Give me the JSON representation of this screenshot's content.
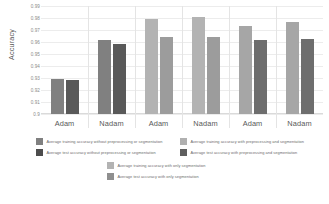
{
  "chart_data": {
    "type": "bar",
    "title": "",
    "xlabel": "",
    "ylabel": "Accuracy",
    "ylim": [
      0.9,
      0.99
    ],
    "grid": true,
    "legend_position": "bottom",
    "categories": [
      "Adam",
      "Nadam",
      "Adam",
      "Nadam",
      "Adam",
      "Nadam"
    ],
    "yticks": [
      "0.99",
      "0.98",
      "0.97",
      "0.96",
      "0.95",
      "0.94",
      "0.93",
      "0.92",
      "0.91",
      "0.9"
    ],
    "ytick_values": [
      0.99,
      0.98,
      0.97,
      0.96,
      0.95,
      0.94,
      0.93,
      0.92,
      0.91,
      0.9
    ],
    "groups": [
      {
        "name": "without preprocessing or segmentation",
        "optimizers": [
          {
            "label": "Adam",
            "training": 0.929,
            "test": 0.9285
          },
          {
            "label": "Nadam",
            "training": 0.962,
            "test": 0.958
          }
        ]
      },
      {
        "name": "with preprocessing and segmentation",
        "optimizers": [
          {
            "label": "Adam",
            "training": 0.9795,
            "test": 0.9645
          },
          {
            "label": "Nadam",
            "training": 0.9805,
            "test": 0.9645
          }
        ]
      },
      {
        "name": "with only segmentation",
        "optimizers": [
          {
            "label": "Adam",
            "training": 0.9735,
            "test": 0.9615
          },
          {
            "label": "Nadam",
            "training": 0.977,
            "test": 0.9625
          }
        ]
      }
    ],
    "series": [
      {
        "name": "Average training accuracy without preprocessing or segmentation",
        "color": "#808080",
        "values": [
          0.929,
          0.962,
          null,
          null,
          null,
          null
        ]
      },
      {
        "name": "Average test accuracy without preprocessing or segmentation",
        "color": "#595959",
        "values": [
          0.9285,
          0.958,
          null,
          null,
          null,
          null
        ]
      },
      {
        "name": "Average training accuracy with preprocessing and segmentation",
        "color": "#b3b3b3",
        "values": [
          null,
          null,
          0.9795,
          0.9805,
          null,
          null
        ]
      },
      {
        "name": "Average test accuracy with preprocessing and segmentation",
        "color": "#9c9c9c",
        "values": [
          null,
          null,
          0.9645,
          0.9645,
          null,
          null
        ]
      },
      {
        "name": "Average training accuracy with only segmentation",
        "color": "#a6a6a6",
        "values": [
          null,
          null,
          null,
          null,
          0.9735,
          0.977
        ]
      },
      {
        "name": "Average test accuracy with only segmentation",
        "color": "#6e6e6e",
        "values": [
          null,
          null,
          null,
          null,
          0.9615,
          0.9625
        ]
      }
    ]
  },
  "legend": {
    "left": [
      {
        "label": "Average training accuracy without preprocessing or segmentation",
        "color": "#808080"
      },
      {
        "label": "Average test accuracy without preprocessing or segmentation",
        "color": "#4d4d4d"
      }
    ],
    "right": [
      {
        "label": "Average training accuracy with preprocessing and segmentation",
        "color": "#b0b0b0"
      },
      {
        "label": "Average test accuracy with preprocessing and segmentation",
        "color": "#5f5f5f"
      }
    ],
    "center": [
      {
        "label": "Average training accuracy with only segmentation",
        "color": "#b3b3b3"
      },
      {
        "label": "Average test accuracy with only segmentation",
        "color": "#8f8f8f"
      }
    ]
  },
  "colors": {
    "grid": "#ececec",
    "axis": "#dadada",
    "text": "#595959",
    "tick_text": "#8a8a8a",
    "background": "#ffffff"
  }
}
